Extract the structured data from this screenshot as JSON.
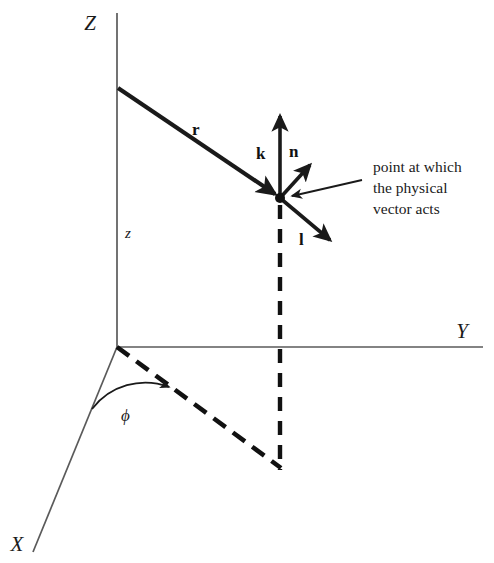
{
  "figure": {
    "background_color": "#ffffff",
    "line_color": "#1a1a1a",
    "axis_color": "#4a4a4a"
  },
  "axes": [
    {
      "name": "z-axis",
      "label": "Z",
      "label_x": 90,
      "label_y": 30,
      "x1": 117,
      "y1": 13,
      "x2": 117,
      "y2": 347
    },
    {
      "name": "y-axis",
      "label": "Y",
      "label_x": 458,
      "label_y": 338,
      "x1": 117,
      "y1": 347,
      "x2": 483,
      "y2": 347
    },
    {
      "name": "x-axis",
      "label": "X",
      "label_x": 10,
      "label_y": 550,
      "x1": 117,
      "y1": 347,
      "x2": 33,
      "y2": 552
    }
  ],
  "coordinate_labels": [
    {
      "name": "z-height-label",
      "text": "z",
      "x": 119,
      "y": 238
    },
    {
      "name": "phi-angle-label",
      "text": "ϕ",
      "x": 121,
      "y": 420
    }
  ],
  "vectors": [
    {
      "name": "position-vector-r",
      "label": "r",
      "label_x": 192,
      "label_y": 134,
      "x1": 118,
      "y1": 88,
      "x2": 278,
      "y2": 196,
      "style": "solid-thick"
    },
    {
      "name": "unit-vector-k",
      "label": "k",
      "label_x": 255,
      "label_y": 159,
      "x1": 280,
      "y1": 198,
      "x2": 280,
      "y2": 111,
      "style": "solid-thick"
    },
    {
      "name": "unit-vector-n",
      "label": "n",
      "label_x": 289,
      "label_y": 156,
      "x1": 280,
      "y1": 198,
      "x2": 313,
      "y2": 161,
      "style": "solid-thick"
    },
    {
      "name": "unit-vector-l",
      "label": "l",
      "label_x": 299,
      "label_y": 244,
      "x1": 280,
      "y1": 198,
      "x2": 334,
      "y2": 244,
      "style": "solid-thick"
    }
  ],
  "dashed_lines": [
    {
      "name": "projection-line-xy-plane",
      "x1": 117,
      "y1": 347,
      "x2": 281,
      "y2": 468
    },
    {
      "name": "vertical-drop-line",
      "x1": 280,
      "y1": 205,
      "x2": 280,
      "y2": 470
    }
  ],
  "point": {
    "name": "vector-application-point",
    "x": 280,
    "y": 198,
    "radius": 5
  },
  "annotation": {
    "name": "point-description",
    "lines": [
      "point at which",
      "the physical",
      "vector acts"
    ],
    "x": 373,
    "y": 172,
    "line_height": 21,
    "pointer": {
      "x1": 362,
      "y1": 180,
      "x2": 289,
      "y2": 197
    }
  },
  "angle_arc": {
    "name": "phi-arc",
    "center_x": 117,
    "center_y": 347,
    "radius": 67,
    "start_angle_deg": 112,
    "end_angle_deg": 36
  }
}
